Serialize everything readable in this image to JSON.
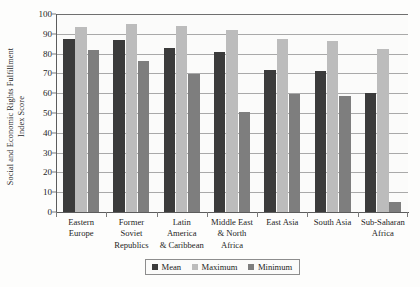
{
  "chart_data": {
    "type": "bar",
    "title": "",
    "xlabel": "",
    "ylabel": "Social and Economic Rights Fulfillment Index Score",
    "ylabel_lines": [
      "Social and Economic Rights Fulfillment",
      "Index Score"
    ],
    "ylim": [
      0,
      100
    ],
    "ytick_step": 10,
    "yticks": [
      0,
      10,
      20,
      30,
      40,
      50,
      60,
      70,
      80,
      90,
      100
    ],
    "ytick_labels": [
      "0",
      "10",
      "20",
      "30",
      "40",
      "50",
      "60",
      "70",
      "80",
      "90",
      "100"
    ],
    "grid": true,
    "grid_axis": "y",
    "legend_position": "bottom",
    "categories": [
      "Eastern Europe",
      "Former Soviet Republics",
      "Latin America & Caribbean",
      "Middle East & North Africa",
      "East Asia",
      "South Asia",
      "Sub-Saharan Africa"
    ],
    "category_label_lines": [
      [
        "Eastern",
        "Europe"
      ],
      [
        "Former",
        "Soviet",
        "Republics"
      ],
      [
        "Latin",
        "America",
        "& Caribbean"
      ],
      [
        "Middle East",
        "& North",
        "Africa"
      ],
      [
        "East Asia"
      ],
      [
        "South Asia"
      ],
      [
        "Sub-Saharan",
        "Africa"
      ]
    ],
    "series": [
      {
        "name": "Mean",
        "color": "#3b3b3b",
        "values": [
          87.5,
          87.0,
          83.0,
          81.0,
          71.5,
          71.0,
          60.0
        ]
      },
      {
        "name": "Maximum",
        "color": "#bcbcbc",
        "values": [
          93.5,
          95.0,
          94.0,
          92.0,
          87.5,
          86.5,
          82.5
        ]
      },
      {
        "name": "Minimum",
        "color": "#7e7e7e",
        "values": [
          82.0,
          76.5,
          69.5,
          50.5,
          59.5,
          58.5,
          5.0
        ]
      }
    ]
  },
  "legend": {
    "items": [
      {
        "label": "Mean",
        "key": "mean"
      },
      {
        "label": "Maximum",
        "key": "maximum"
      },
      {
        "label": "Minimum",
        "key": "minimum"
      }
    ]
  }
}
